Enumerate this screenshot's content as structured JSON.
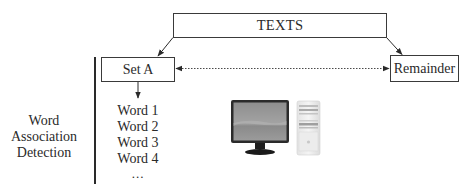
{
  "diagram": {
    "top_box": {
      "label": "TEXTS"
    },
    "left_box": {
      "label": "Set A"
    },
    "right_box": {
      "label": "Remainder"
    },
    "side_label": {
      "lines": [
        "Word",
        "Association",
        "Detection"
      ]
    },
    "word_list": {
      "items": [
        "Word 1",
        "Word 2",
        "Word 3",
        "Word 4"
      ],
      "ellipsis": "..."
    },
    "icons": {
      "computer": "desktop-computer-icon"
    },
    "connectors": [
      {
        "from": "TEXTS",
        "to": "Set A",
        "style": "solid-arrow"
      },
      {
        "from": "TEXTS",
        "to": "Remainder",
        "style": "solid-arrow"
      },
      {
        "from": "Set A",
        "to": "Remainder",
        "style": "dotted-double-arrow"
      },
      {
        "from": "Set A",
        "to": "word_list",
        "style": "solid-arrow"
      }
    ],
    "colors": {
      "line": "#2a2a2a",
      "text": "#2a2a2a",
      "background": "#ffffff"
    }
  }
}
